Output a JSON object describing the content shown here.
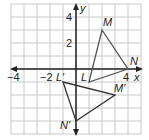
{
  "diagram": {
    "type": "coordinate-plane-transformation",
    "grid": {
      "xmin": -5,
      "xmax": 5,
      "ymin": -5,
      "ymax": 5,
      "cell_px": 13,
      "origin_px": [
        76,
        69
      ]
    },
    "axes": {
      "x_label": "x",
      "y_label": "y"
    },
    "tick_labels": {
      "x": [
        {
          "value": -4,
          "text": "−4"
        },
        {
          "value": -2,
          "text": "−2"
        },
        {
          "value": 4,
          "text": "4"
        }
      ],
      "y": [
        {
          "value": 4,
          "text": "4"
        },
        {
          "value": 2,
          "text": "2"
        }
      ]
    },
    "colors": {
      "grid": "#c8c8c8",
      "axis": "#222222",
      "triangle_original": "#555555",
      "triangle_image": "#333333"
    },
    "triangles": [
      {
        "name": "LMN",
        "vertices": [
          {
            "label": "L",
            "x": 1,
            "y": -1
          },
          {
            "label": "M",
            "x": 2,
            "y": 3
          },
          {
            "label": "N",
            "x": 4,
            "y": 0
          }
        ]
      },
      {
        "name": "L'M'N'",
        "vertices": [
          {
            "label": "L′",
            "x": -1,
            "y": -1
          },
          {
            "label": "M′",
            "x": 3,
            "y": -2
          },
          {
            "label": "N′",
            "x": 0,
            "y": -4
          }
        ]
      }
    ]
  }
}
